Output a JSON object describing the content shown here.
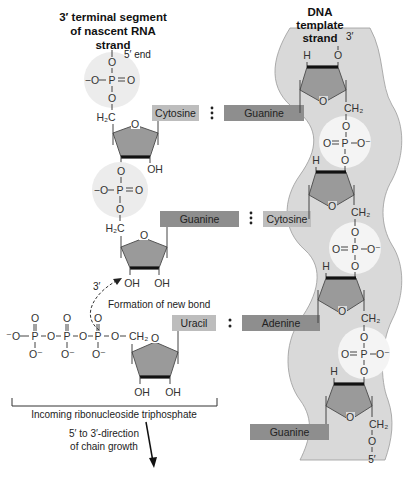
{
  "rna_strand": {
    "title_lines": [
      "3′ terminal segment",
      "of nascent RNA",
      "strand"
    ],
    "end_label": "5′ end",
    "phosphates": [
      {
        "left": "−O",
        "center": "P",
        "right": "O",
        "top": "O",
        "bottom": "O"
      },
      {
        "left": "−O",
        "center": "P",
        "right": "O",
        "top": "O",
        "bottom": "O"
      }
    ],
    "sugar_labels": {
      "h2c": "H₂C",
      "ring_o": "O",
      "oh": "OH",
      "o": "O"
    },
    "three_prime_label": "3′"
  },
  "dna_strand": {
    "title_lines": [
      "DNA",
      "template",
      "strand"
    ],
    "top_end": "3′",
    "bottom_end": "5′",
    "atoms": {
      "h": "H",
      "o": "O",
      "ch2": "CH₂",
      "p": "P",
      "o_minus": "O⁻",
      "double_o": "O"
    }
  },
  "base_pairs": [
    {
      "rna_base": "Cytosine",
      "dna_base": "Guanine",
      "separator": "⋮"
    },
    {
      "rna_base": "Guanine",
      "dna_base": "Cytosine",
      "separator": "⋮"
    },
    {
      "rna_base": "Uracil",
      "dna_base": "Adenine",
      "separator": ":"
    },
    {
      "rna_base": "",
      "dna_base": "Guanine",
      "separator": ""
    }
  ],
  "incoming_ntp": {
    "triphosphate": {
      "o_minus": "⁻O",
      "p": "P",
      "o": "O",
      "o_neg": "O⁻",
      "ch2": "CH₂"
    },
    "bracket_label": "Incoming ribonucleoside triphosphate",
    "bond_label": "Formation of new bond"
  },
  "growth": {
    "line1": "5′ to 3′-direction",
    "line2": "of chain growth"
  },
  "colors": {
    "base_light": "#bdbdbd",
    "base_dark": "#8e8e8e",
    "sugar": "#9a9a9a",
    "dna_band": "#d9d9d9"
  }
}
